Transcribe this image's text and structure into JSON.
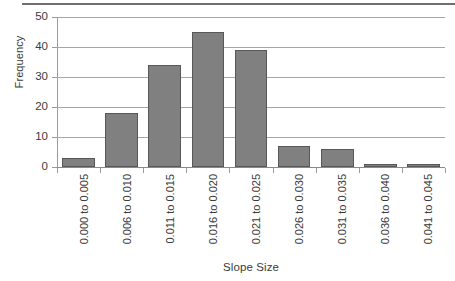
{
  "chart_data": {
    "type": "bar",
    "title": "",
    "subtitle": "",
    "xlabel": "Slope Size",
    "ylabel": "Frequency",
    "categories": [
      "0.000 to 0.005",
      "0.006 to 0.010",
      "0.011 to 0.015",
      "0.016 to 0.020",
      "0.021 to 0.025",
      "0.026 to 0.030",
      "0.031 to 0.035",
      "0.036 to 0.040",
      "0.041 to 0.045"
    ],
    "values": [
      3,
      18,
      34,
      45,
      39,
      7,
      6,
      1,
      1
    ],
    "ylim": [
      0,
      50
    ],
    "yticks": [
      0,
      10,
      20,
      30,
      40,
      50
    ],
    "ytick_labels": [
      "0",
      "10",
      "20",
      "30",
      "40",
      "50"
    ],
    "grid": "horizontal",
    "legend": "none",
    "bar_color": "#808080",
    "bar_border_color": "#585858",
    "gridline_color": "#a6a6a6",
    "axis_color": "#9b9b9b",
    "text_color": "#3a3a3a",
    "background": "#ffffff",
    "xtick_label_rotation": -90,
    "annotations": []
  }
}
